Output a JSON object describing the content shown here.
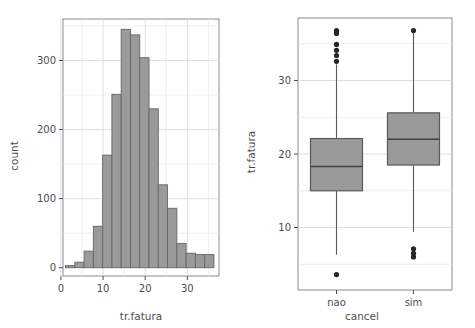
{
  "chart_data": [
    {
      "type": "bar",
      "id": "histogram",
      "title": "",
      "xlabel": "tr.fatura",
      "ylabel": "count",
      "xlim": [
        0.5,
        37.5
      ],
      "ylim": [
        -12,
        360
      ],
      "xticks": [
        0,
        10,
        20,
        30
      ],
      "xtick_labels": [
        "0",
        "10",
        "20",
        "30"
      ],
      "yticks": [
        0,
        100,
        200,
        300
      ],
      "ytick_labels": [
        "0",
        "100",
        "200",
        "300"
      ],
      "grid": true,
      "bin_width": 2.2,
      "bar_fill": "#9a9a9a",
      "bar_stroke": "#666666",
      "bin_centers": [
        2.2,
        4.4,
        6.6,
        8.8,
        11.0,
        13.2,
        15.4,
        17.6,
        19.8,
        22.0,
        24.2,
        26.4,
        28.6,
        30.8,
        33.0,
        35.2
      ],
      "values": [
        3,
        8,
        24,
        60,
        163,
        251,
        345,
        337,
        304,
        230,
        120,
        86,
        35,
        21,
        19,
        19
      ]
    },
    {
      "type": "box",
      "id": "boxplot",
      "title": "",
      "xlabel": "cancel",
      "ylabel": "tr.fatura",
      "ylim": [
        1.5,
        38.5
      ],
      "yticks": [
        10,
        20,
        30
      ],
      "ytick_labels": [
        "10",
        "20",
        "30"
      ],
      "categories": [
        "nao",
        "sim"
      ],
      "grid": true,
      "box_fill": "#9a9a9a",
      "box_stroke": "#595959",
      "outlier_color": "#262626",
      "boxes": [
        {
          "label": "nao",
          "whisker_low": 6.3,
          "q1": 15.0,
          "median": 18.3,
          "q3": 22.1,
          "whisker_high": 32.2,
          "outliers": [
            3.6,
            32.6,
            33.4,
            34.1,
            34.9,
            36.4,
            36.8
          ]
        },
        {
          "label": "sim",
          "whisker_low": 9.4,
          "q1": 18.5,
          "median": 22.0,
          "q3": 25.6,
          "whisker_high": 36.5,
          "outliers": [
            6.0,
            6.5,
            7.1,
            36.8
          ]
        }
      ]
    }
  ]
}
